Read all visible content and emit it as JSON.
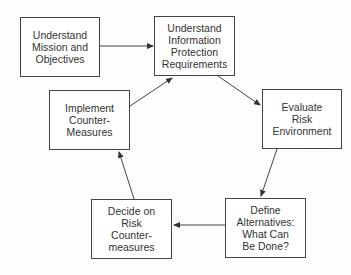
{
  "diagram": {
    "type": "cycle-flowchart",
    "nodes": [
      {
        "id": "mission",
        "lines": [
          "Understand",
          "Mission and",
          "Objectives"
        ],
        "box": [
          20,
          17,
          80,
          60
        ]
      },
      {
        "id": "requirements",
        "lines": [
          "Understand",
          "Information",
          "Protection",
          "Requirements"
        ],
        "box": [
          154,
          16,
          81,
          60
        ]
      },
      {
        "id": "evaluate",
        "lines": [
          "Evaluate",
          "Risk",
          "Environment"
        ],
        "box": [
          262,
          89,
          80,
          60
        ]
      },
      {
        "id": "define",
        "lines": [
          "Define",
          "Alternatives:",
          "What Can",
          "Be Done?"
        ],
        "box": [
          225,
          198,
          81,
          60
        ]
      },
      {
        "id": "decide",
        "lines": [
          "Decide on",
          "Risk",
          "Counter-",
          "measures"
        ],
        "box": [
          91,
          199,
          81,
          60
        ]
      },
      {
        "id": "implement",
        "lines": [
          "Implement",
          "Counter-",
          "Measures"
        ],
        "box": [
          49,
          90,
          81,
          60
        ]
      }
    ],
    "edges": [
      {
        "from": "mission",
        "to": "requirements",
        "points": [
          100,
          46,
          153,
          46
        ]
      },
      {
        "from": "requirements",
        "to": "evaluate",
        "points": [
          218,
          76,
          260,
          105
        ]
      },
      {
        "from": "evaluate",
        "to": "define",
        "points": [
          277,
          149,
          261,
          196
        ]
      },
      {
        "from": "define",
        "to": "decide",
        "points": [
          225,
          225,
          174,
          225
        ]
      },
      {
        "from": "decide",
        "to": "implement",
        "points": [
          134,
          199,
          119,
          152
        ]
      },
      {
        "from": "implement",
        "to": "requirements",
        "points": [
          130,
          106,
          172,
          78
        ]
      }
    ],
    "colors": {
      "stroke": "#444444",
      "text": "#333333",
      "fill": "#ffffff"
    }
  }
}
